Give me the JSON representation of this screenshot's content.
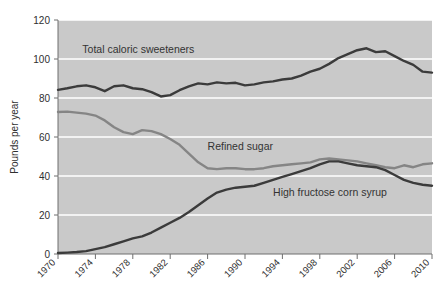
{
  "chart_data": {
    "type": "line",
    "title": "",
    "subtitle": "",
    "xlabel": "",
    "ylabel": "Pounds per year",
    "ylim": [
      0,
      120
    ],
    "xlim": [
      1970,
      2010
    ],
    "yticks": [
      0,
      20,
      40,
      60,
      80,
      100,
      120
    ],
    "ytick_labels": [
      "0",
      "20",
      "40",
      "60",
      "80",
      "100",
      "120"
    ],
    "xticks": [
      1970,
      1974,
      1978,
      1982,
      1986,
      1990,
      1994,
      1998,
      2002,
      2006,
      2010
    ],
    "xtick_labels": [
      "1970",
      "1974",
      "1978",
      "1982",
      "1986",
      "1990",
      "1994",
      "1998",
      "2002",
      "2006",
      "2010"
    ],
    "grid": "horizontal-white-on-gray",
    "plot_background": "#c9c9c9",
    "gridline_color": "#ffffff",
    "legend_position": "inline-annotations",
    "x": [
      1970,
      1971,
      1972,
      1973,
      1974,
      1975,
      1976,
      1977,
      1978,
      1979,
      1980,
      1981,
      1982,
      1983,
      1984,
      1985,
      1986,
      1987,
      1988,
      1989,
      1990,
      1991,
      1992,
      1993,
      1994,
      1995,
      1996,
      1997,
      1998,
      1999,
      2000,
      2001,
      2002,
      2003,
      2004,
      2005,
      2006,
      2007,
      2008,
      2009,
      2010
    ],
    "series": [
      {
        "name": "Total caloric sweeteners",
        "color": "#3b3b3b",
        "label_x": 1972.6,
        "label_y": 103.0,
        "values": [
          84.2,
          85.0,
          86.0,
          86.5,
          85.5,
          83.5,
          86.0,
          86.5,
          85.0,
          84.5,
          83.0,
          80.8,
          81.5,
          84.0,
          86.0,
          87.5,
          87.0,
          88.0,
          87.5,
          87.8,
          86.5,
          87.0,
          88.0,
          88.5,
          89.5,
          90.0,
          91.5,
          93.5,
          95.0,
          97.5,
          100.5,
          102.5,
          104.5,
          105.5,
          103.5,
          104.0,
          101.5,
          99.0,
          97.0,
          93.5,
          93.0
        ]
      },
      {
        "name": "Refined sugar",
        "color": "#858585",
        "label_x": 1986.0,
        "label_y": 53.5,
        "values": [
          72.8,
          73.0,
          72.5,
          72.0,
          71.0,
          68.5,
          65.0,
          62.5,
          61.5,
          63.5,
          63.0,
          61.5,
          59.0,
          56.0,
          51.5,
          47.0,
          44.0,
          43.5,
          44.0,
          44.0,
          43.5,
          43.5,
          44.0,
          45.0,
          45.5,
          46.0,
          46.5,
          47.0,
          48.5,
          49.0,
          48.5,
          48.0,
          47.5,
          46.5,
          45.5,
          44.5,
          44.0,
          45.5,
          44.5,
          46.0,
          46.5
        ]
      },
      {
        "name": "High fructose corn syrup",
        "color": "#3b3b3b",
        "label_x": 1993.0,
        "label_y": 29.5,
        "values": [
          0.5,
          0.7,
          1.0,
          1.5,
          2.5,
          3.5,
          5.0,
          6.5,
          8.0,
          9.0,
          11.0,
          13.5,
          16.0,
          18.5,
          21.5,
          25.0,
          28.5,
          31.5,
          33.0,
          34.0,
          34.5,
          35.0,
          36.5,
          38.0,
          39.5,
          41.0,
          42.5,
          44.0,
          46.0,
          47.5,
          47.5,
          46.5,
          45.5,
          45.0,
          44.5,
          43.0,
          40.5,
          38.0,
          36.5,
          35.5,
          35.0
        ]
      }
    ]
  },
  "figure": {
    "background": "#ffffff"
  }
}
